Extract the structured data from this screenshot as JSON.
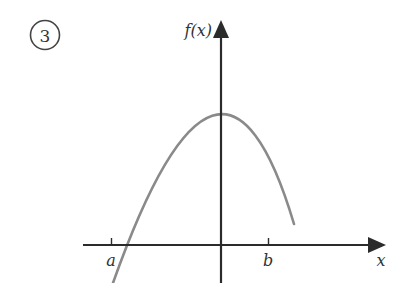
{
  "problem": {
    "number": "3"
  },
  "axes": {
    "x_label": "x",
    "y_label": "f(x)",
    "axis_color": "#2b2b2b"
  },
  "ticks": [
    {
      "label": "a"
    },
    {
      "label": "b"
    }
  ],
  "curve": {
    "type": "downward parabola",
    "color": "#8a8a8a",
    "description": "Concave-down curve with maximum on the f(x) axis; crosses the x-axis between a and the origin, ends above the x-axis before b's right side"
  }
}
